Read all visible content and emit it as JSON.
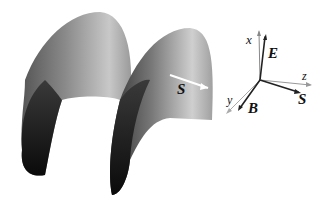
{
  "figure": {
    "surface": {
      "description": "3D helical wave surface (two arches)",
      "vector_label": "S"
    },
    "axes": {
      "x": "x",
      "y": "y",
      "z": "z",
      "E": "E",
      "B": "B",
      "S": "S"
    }
  }
}
